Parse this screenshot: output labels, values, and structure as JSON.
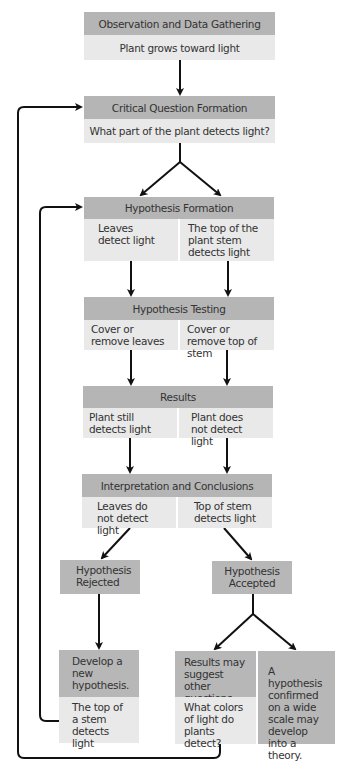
{
  "diagram": {
    "observation": {
      "title": "Observation and Data Gathering",
      "text": "Plant grows toward light"
    },
    "question": {
      "title": "Critical Question Formation",
      "text": "What part of the plant detects light?"
    },
    "hypothesis_formation": {
      "title": "Hypothesis Formation",
      "left": "Leaves detect light",
      "right": "The top of the plant stem detects light"
    },
    "hypothesis_testing": {
      "title": "Hypothesis Testing",
      "left": "Cover or remove leaves",
      "right": "Cover or remove top of stem"
    },
    "results": {
      "title": "Results",
      "left": "Plant still detects light",
      "right": "Plant does not detect light"
    },
    "interpretation": {
      "title": "Interpretation and Conclusions",
      "left": "Leaves do not detect light",
      "right": "Top of stem detects light"
    },
    "rejected": {
      "title": "Hypothesis Rejected"
    },
    "accepted": {
      "title": "Hypothesis Accepted"
    },
    "develop": {
      "title": "Develop a new hypothesis.",
      "text": "The top of a stem detects light"
    },
    "suggest": {
      "title": "Results may suggest other questions.",
      "text": "What colors of light do plants detect?"
    },
    "theory": {
      "text": "A hypothesis confirmed on a wide scale may develop into a theory."
    }
  },
  "colors": {
    "header": "#b5b5b5",
    "body": "#e9e9e9",
    "arrow": "#111111"
  }
}
